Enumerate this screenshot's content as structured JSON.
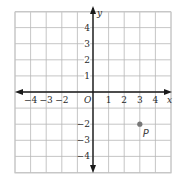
{
  "diagram": {
    "type": "coordinate-plane",
    "grid": {
      "x_min": -5,
      "x_max": 5,
      "y_min": -5,
      "y_max": 5,
      "cell_px_x": 15.6,
      "cell_px_y": 16.1,
      "origin_px": [
        93,
        92
      ],
      "left_px": 15,
      "top_px": 12,
      "right_px": 171,
      "bottom_px": 173,
      "grid_color": "#b8b8b8",
      "axis_color": "#1a1a1a",
      "border_color": "#c8c8c8"
    },
    "axes": {
      "x_label": "x",
      "y_label": "y",
      "origin_label": "O"
    },
    "x_ticks": [
      {
        "value": -4,
        "label": "−4"
      },
      {
        "value": -3,
        "label": "−3"
      },
      {
        "value": -2,
        "label": "−2"
      },
      {
        "value": 1,
        "label": "1"
      },
      {
        "value": 2,
        "label": "2"
      },
      {
        "value": 3,
        "label": "3"
      },
      {
        "value": 4,
        "label": "4"
      }
    ],
    "y_ticks": [
      {
        "value": 4,
        "label": "4"
      },
      {
        "value": 3,
        "label": "3"
      },
      {
        "value": 2,
        "label": "2"
      },
      {
        "value": 1,
        "label": "1"
      },
      {
        "value": -2,
        "label": "−2"
      },
      {
        "value": -3,
        "label": "−3"
      },
      {
        "value": -4,
        "label": "−4"
      }
    ],
    "points": [
      {
        "name": "P",
        "x": 3,
        "y": -2,
        "color": "#777777"
      }
    ]
  }
}
